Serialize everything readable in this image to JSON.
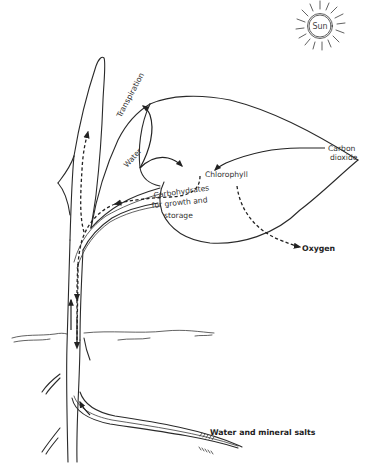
{
  "diagram": {
    "type": "plant physiology flow diagram",
    "sun": {
      "label": "Sun"
    },
    "labels": {
      "transpiration": "Transpiration",
      "water": "Water",
      "chlorophyll": "Chlorophyll",
      "carbon_dioxide_line1": "Carbon",
      "carbon_dioxide_line2": "dioxide",
      "carbohydrates_line1": "Carbohydrates",
      "carbohydrates_line2": "for growth and",
      "carbohydrates_line3": "storage",
      "oxygen": "Oxygen",
      "water_and_mineral_salts": "Water and mineral salts"
    },
    "flows": [
      {
        "from": "Water and mineral salts",
        "to": "Chlorophyll",
        "style": "solid",
        "via": "root, stem, leaf vein"
      },
      {
        "from": "leaf",
        "to": "Transpiration",
        "style": "solid"
      },
      {
        "from": "Carbon dioxide",
        "to": "Chlorophyll",
        "style": "solid"
      },
      {
        "from": "Chlorophyll",
        "to": "Oxygen",
        "style": "dashed"
      },
      {
        "from": "Chlorophyll",
        "to": "Carbohydrates for growth and storage",
        "style": "dashed",
        "via": "stem up and down"
      }
    ],
    "colors": {
      "line": "#2a2a2a",
      "background": "#ffffff"
    }
  }
}
